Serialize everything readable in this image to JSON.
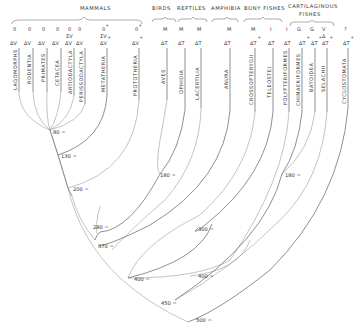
{
  "groups": {
    "mammals": "MAMMALS",
    "birds": "BIRDS",
    "reptiles": "REPTILES",
    "amphibia": "AMPHIBIA",
    "bony_fishes": "BONY FISHES",
    "cartilaginous_1": "CARTILAGINOUS",
    "cartilaginous_2": "FISHES"
  },
  "taxa": [
    {
      "name": "LAGOMORPHS",
      "top": "0",
      "code": "ΔV",
      "star": false
    },
    {
      "name": "RODENTIA",
      "top": "0",
      "code": "ΔV",
      "star": false
    },
    {
      "name": "PRIMATES",
      "top": "0",
      "code": "ΔV",
      "star": false
    },
    {
      "name": "CETACEA",
      "top": "0",
      "code": "ΔV",
      "star": false
    },
    {
      "name": "ARTIODACTYLA",
      "top": "0",
      "code": "ΔV",
      "star": false,
      "extra": "ΣV"
    },
    {
      "name": "PERISSODACTYLA",
      "top": "0",
      "code": "ΔV",
      "star": false
    },
    {
      "name": "METATHERIA",
      "top": "0",
      "code": "ΔV",
      "star": true,
      "top_star": true,
      "extra": "ΣV"
    },
    {
      "name": "PROTOTHERIA",
      "top": "0",
      "code": "ΔV",
      "star": true,
      "top_star": true
    },
    {
      "name": "AVES",
      "top": "M",
      "code": "ΔT",
      "star": false
    },
    {
      "name": "OPHIDIA",
      "top": "M",
      "code": "ΔT",
      "star": false
    },
    {
      "name": "LACERTILIA",
      "top": "M",
      "code": "ΔT",
      "star": false
    },
    {
      "name": "ANURA",
      "top": "M",
      "code": "ΔT",
      "star": false
    },
    {
      "name": "CROSSOPTERYGII",
      "top": "M",
      "code": "ΔT",
      "star": true
    },
    {
      "name": "TELEOSTEI",
      "top": "I",
      "code": "ΔT",
      "star": false
    },
    {
      "name": "POLYPTERIFORMES",
      "top": "I",
      "code": "ΔT",
      "star": false
    },
    {
      "name": "CHIMAERIFORMES",
      "top": "G",
      "code": "ΔT",
      "star": true
    },
    {
      "name": "BATOIDEA",
      "top": "G",
      "code": "ΔT",
      "star": true
    },
    {
      "name": "SELACHII",
      "top": "V",
      "code": "ΔT",
      "star": true,
      "extra": "Δ"
    },
    {
      "name": "CYCLOSTOMATA",
      "top": "?",
      "code": "ΔT",
      "star": true
    }
  ],
  "ages": [
    {
      "label": "80 ="
    },
    {
      "label": "130 ="
    },
    {
      "label": "200 ="
    },
    {
      "label": "180 ="
    },
    {
      "label": "280 ="
    },
    {
      "label": "370 ="
    },
    {
      "label": "300 ="
    },
    {
      "label": "400 ="
    },
    {
      "label": "400 ="
    },
    {
      "label": "180 ="
    },
    {
      "label": "450 ="
    },
    {
      "label": "500 ="
    }
  ]
}
